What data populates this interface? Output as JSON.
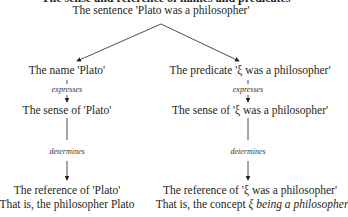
{
  "title": "The sense and reference of names and predicates",
  "root": "The sentence 'Plato was a philosopher'",
  "left": {
    "node1": "The name 'Plato'",
    "rel1": "expresses",
    "node2": "The sense of 'Plato'",
    "rel2": "determines",
    "node3": "The reference of 'Plato'",
    "node3b": "That is, the philosopher Plato"
  },
  "right": {
    "node1": "The predicate 'ξ was a philosopher'",
    "rel1": "expresses",
    "node2": "The sense of 'ξ was a philosopher'",
    "rel2": "determines",
    "node3": "The reference of 'ξ was a philosopher'",
    "node3b_prefix": "That is, the concept ",
    "node3b_italic": "ξ being a philosopher"
  }
}
